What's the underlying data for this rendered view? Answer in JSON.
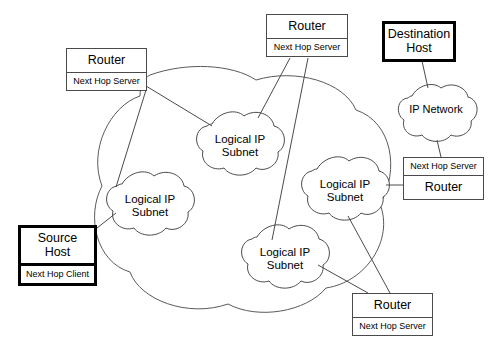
{
  "diagram": {
    "colors": {
      "background": "#ffffff",
      "line": "#4a4a4a",
      "emphasis_border": "#000000",
      "text": "#000000"
    },
    "outer_cloud": {
      "name": "outer-network-cloud",
      "label": ""
    },
    "clouds": [
      {
        "id": "subnet-top-center",
        "label": "Logical IP\nSubnet",
        "cx": 240,
        "cy": 140,
        "rx": 46,
        "ry": 32
      },
      {
        "id": "subnet-left",
        "label": "Logical IP\nSubnet",
        "cx": 150,
        "cy": 200,
        "rx": 46,
        "ry": 32
      },
      {
        "id": "subnet-right",
        "label": "Logical IP\nSubnet",
        "cx": 345,
        "cy": 185,
        "rx": 46,
        "ry": 32
      },
      {
        "id": "subnet-bottom-center",
        "label": "Logical IP\nSubnet",
        "cx": 285,
        "cy": 253,
        "rx": 46,
        "ry": 32
      },
      {
        "id": "ip-network",
        "label": "IP Network",
        "cx": 436,
        "cy": 110,
        "rx": 40,
        "ry": 28
      }
    ],
    "nodes": [
      {
        "id": "router-left",
        "title": "Router",
        "subtitle": "Next Hop Server",
        "emphasis": false,
        "subtitle_on_top": false,
        "x": 66,
        "y": 48,
        "width": 81,
        "height": 43
      },
      {
        "id": "router-top",
        "title": "Router",
        "subtitle": "Next Hop Server",
        "emphasis": false,
        "subtitle_on_top": false,
        "x": 266,
        "y": 14,
        "width": 82,
        "height": 44
      },
      {
        "id": "destination-host",
        "title": "Destination\nHost",
        "subtitle": "",
        "emphasis": true,
        "subtitle_on_top": false,
        "x": 382,
        "y": 21,
        "width": 74,
        "height": 40
      },
      {
        "id": "router-right",
        "title": "Router",
        "subtitle": "Next Hop Server",
        "emphasis": false,
        "subtitle_on_top": true,
        "x": 403,
        "y": 157,
        "width": 81,
        "height": 42
      },
      {
        "id": "source-host",
        "title": "Source\nHost",
        "subtitle": "Next Hop Client",
        "emphasis": true,
        "subtitle_on_top": false,
        "x": 18,
        "y": 225,
        "width": 79,
        "height": 50
      },
      {
        "id": "router-bottom",
        "title": "Router",
        "subtitle": "Next Hop Server",
        "emphasis": false,
        "subtitle_on_top": false,
        "x": 352,
        "y": 293,
        "width": 81,
        "height": 43
      }
    ],
    "links": [
      {
        "id": "link-router-left-to-subnet-left",
        "from": "router-left",
        "to": "subnet-left"
      },
      {
        "id": "link-router-left-to-subnet-top-center",
        "from": "router-left",
        "to": "subnet-top-center"
      },
      {
        "id": "link-router-top-to-subnet-top-center",
        "from": "router-top",
        "to": "subnet-top-center"
      },
      {
        "id": "link-router-top-to-subnet-bottom-center",
        "from": "router-top",
        "to": "subnet-bottom-center"
      },
      {
        "id": "link-destination-host-to-ip-network",
        "from": "destination-host",
        "to": "ip-network"
      },
      {
        "id": "link-ip-network-to-router-right",
        "from": "ip-network",
        "to": "router-right"
      },
      {
        "id": "link-router-right-to-subnet-right",
        "from": "router-right",
        "to": "subnet-right"
      },
      {
        "id": "link-source-host-to-subnet-left",
        "from": "source-host",
        "to": "subnet-left"
      },
      {
        "id": "link-subnet-right-to-router-bottom",
        "from": "subnet-right",
        "to": "router-bottom"
      },
      {
        "id": "link-subnet-bottom-center-to-router-bottom",
        "from": "subnet-bottom-center",
        "to": "router-bottom"
      }
    ]
  }
}
